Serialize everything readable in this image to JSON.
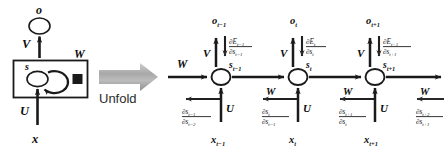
{
  "figure": {
    "colors": {
      "stroke": "#1a1a1a",
      "fill": "#ffffff",
      "arrow_gray": "#b4b4b4",
      "arrow_gray_dark": "#8c8c8c",
      "text": "#0d0d0d",
      "grad_text": "#1f1f1f"
    }
  },
  "folded": {
    "output_node_label": "o",
    "state_node_label": "s",
    "input_label": "x",
    "weight_v": "V",
    "weight_u": "U",
    "weight_w": "W",
    "box_name": "recurrent-cell-box",
    "self_loop_name": "recurrent-self-loop",
    "delay_unit_name": "delay-square"
  },
  "transition": {
    "label": "Unfold",
    "arrow_name": "unfold-block-arrow"
  },
  "unfolded": {
    "incoming_w": "W",
    "outgoing_w": "W",
    "steps": [
      {
        "key": "t-1",
        "output": {
          "base": "o",
          "sub": "t−1"
        },
        "state": {
          "base": "s",
          "sub": "t−1"
        },
        "input": {
          "base": "x",
          "sub": "t−1"
        },
        "weight_v": "V",
        "weight_u": "U",
        "weight_w_forward": "W",
        "weight_w_backward": "W",
        "grad_output": {
          "num_base": "∂E",
          "num_sub": "t−1",
          "den_base": "∂s",
          "den_sub": "t−1"
        },
        "grad_state": {
          "num_base": "∂s",
          "num_sub": "t−1",
          "den_base": "∂s",
          "den_sub": "t−2"
        }
      },
      {
        "key": "t",
        "output": {
          "base": "o",
          "sub": "t"
        },
        "state": {
          "base": "s",
          "sub": "t"
        },
        "input": {
          "base": "x",
          "sub": "t"
        },
        "weight_v": "V",
        "weight_u": "U",
        "weight_w_forward": "W",
        "weight_w_backward": "W",
        "grad_output": {
          "num_base": "∂E",
          "num_sub": "t",
          "den_base": "∂s",
          "den_sub": "t"
        },
        "grad_state": {
          "num_base": "∂s",
          "num_sub": "t",
          "den_base": "∂s",
          "den_sub": "t−1"
        }
      },
      {
        "key": "t+1",
        "output": {
          "base": "o",
          "sub": "t+1"
        },
        "state": {
          "base": "s",
          "sub": "t+1"
        },
        "input": {
          "base": "x",
          "sub": "t+1"
        },
        "weight_v": "V",
        "weight_u": "U",
        "weight_w_forward": "W",
        "weight_w_backward": "W",
        "grad_output": {
          "num_base": "∂E",
          "num_sub": "t+1",
          "den_base": "∂s",
          "den_sub": "t+1"
        },
        "grad_state": {
          "num_base": "∂s",
          "num_sub": "t+1",
          "den_base": "∂s",
          "den_sub": "t"
        }
      },
      {
        "key": "t+2-tail",
        "grad_state": {
          "num_base": "∂s",
          "num_sub": "t+2",
          "den_base": "∂s",
          "den_sub": "t+1"
        },
        "weight_w_backward": "W"
      }
    ]
  }
}
